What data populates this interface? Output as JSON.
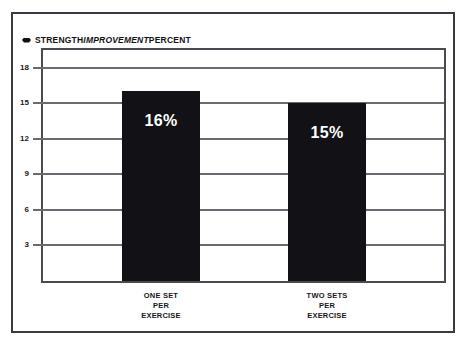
{
  "chart_data": {
    "type": "bar",
    "title": "STRENGTH IMPROVEMENT PERCENT",
    "title_parts": {
      "part1": "STRENGTH ",
      "part2": "IMPROVEMENT",
      "part3": " PERCENT"
    },
    "title_marker": "diamond-bullet",
    "categories": [
      "ONE SET\nPER\nEXERCISE",
      "TWO SETS\nPER\nEXERCISE"
    ],
    "values": [
      16,
      15
    ],
    "value_labels": [
      "16%",
      "15%"
    ],
    "xlabel": "",
    "ylabel": "",
    "ylim": [
      0,
      19.5
    ],
    "yticks": [
      18,
      15,
      12,
      9,
      6,
      3
    ],
    "ytick_labels": [
      "18",
      "15",
      "12",
      "9",
      "6",
      "3"
    ],
    "grid": true,
    "legend": false,
    "colors": {
      "bar": "#121216",
      "value_text": "#ffffff",
      "gridline": "#6a6a72",
      "frame": "#4a4a52",
      "outer_border": "#3a3a42",
      "background": "#ffffff",
      "text": "#111114"
    }
  }
}
